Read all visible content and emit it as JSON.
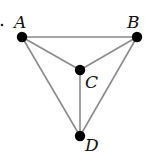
{
  "diagram": {
    "type": "graph",
    "nodes": [
      {
        "id": "A",
        "label": "A",
        "x": 22,
        "y": 37,
        "lx": 14,
        "ly": 28
      },
      {
        "id": "B",
        "label": "B",
        "x": 137,
        "y": 37,
        "lx": 127,
        "ly": 28
      },
      {
        "id": "C",
        "label": "C",
        "x": 80,
        "y": 70,
        "lx": 85,
        "ly": 88
      },
      {
        "id": "D",
        "label": "D",
        "x": 80,
        "y": 136,
        "lx": 85,
        "ly": 151
      }
    ],
    "edges": [
      {
        "from": "A",
        "to": "B"
      },
      {
        "from": "A",
        "to": "C"
      },
      {
        "from": "B",
        "to": "C"
      },
      {
        "from": "A",
        "to": "D"
      },
      {
        "from": "B",
        "to": "D"
      },
      {
        "from": "C",
        "to": "D"
      }
    ],
    "colors": {
      "edge": "#8a8a8a",
      "node": "#000000"
    }
  }
}
